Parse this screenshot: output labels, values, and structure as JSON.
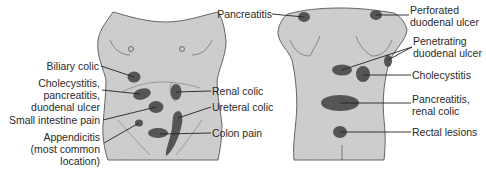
{
  "figure": {
    "colors": {
      "skin": "#cfcfcf",
      "outline": "#3a3a3a",
      "spot": "#555555",
      "leader": "#222222",
      "text": "#2a2a2a"
    },
    "front_view": {
      "labels": [
        {
          "id": "biliary-colic",
          "lines": [
            "Biliary colic"
          ]
        },
        {
          "id": "cholecystitis-front",
          "lines": [
            "Cholecystitis,",
            "pancreatitis,",
            "duodenal ulcer"
          ]
        },
        {
          "id": "small-intestine",
          "lines": [
            "Small intestine pain"
          ]
        },
        {
          "id": "appendicitis",
          "lines": [
            "Appendicitis",
            "(most common",
            "location)"
          ]
        },
        {
          "id": "renal-colic",
          "lines": [
            "Renal colic"
          ]
        },
        {
          "id": "ureteral-colic",
          "lines": [
            "Ureteral colic"
          ]
        },
        {
          "id": "colon-pain",
          "lines": [
            "Colon pain"
          ]
        }
      ]
    },
    "back_view": {
      "labels": [
        {
          "id": "pancreatitis-back",
          "lines": [
            "Pancreatitis"
          ]
        },
        {
          "id": "perforated-du",
          "lines": [
            "Perforated",
            "duodenal ulcer"
          ]
        },
        {
          "id": "penetrating-du",
          "lines": [
            "Penetrating",
            "duodenal ulcer"
          ]
        },
        {
          "id": "cholecystitis-back",
          "lines": [
            "Cholecystitis"
          ]
        },
        {
          "id": "pancreatitis-renal",
          "lines": [
            "Pancreatitis,",
            "renal colic"
          ]
        },
        {
          "id": "rectal-lesions",
          "lines": [
            "Rectal lesions"
          ]
        }
      ]
    }
  }
}
